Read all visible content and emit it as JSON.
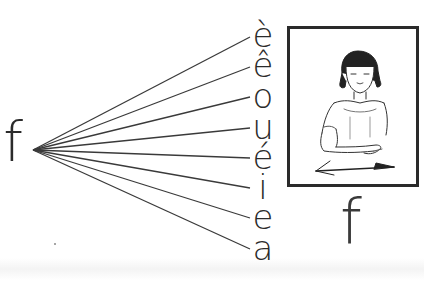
{
  "diagram": {
    "source_letter": "f",
    "target_vowels": [
      "è",
      "ê",
      "o",
      "u",
      "é",
      "i",
      "e",
      "a"
    ],
    "caption_letter": "f",
    "illustration": {
      "subject": "girl-signing-letter-f",
      "description": "Girl with bob haircut moving hand to the left, arrow pointing left"
    },
    "colors": {
      "ink": "#2b2b2b",
      "frame": "#2a2a2a",
      "background": "#ffffff"
    },
    "fan_origin": {
      "x": 33,
      "y": 150
    },
    "fan_endpoints": [
      {
        "x": 250,
        "y": 37
      },
      {
        "x": 250,
        "y": 67
      },
      {
        "x": 250,
        "y": 97
      },
      {
        "x": 250,
        "y": 128
      },
      {
        "x": 250,
        "y": 158
      },
      {
        "x": 250,
        "y": 188
      },
      {
        "x": 250,
        "y": 218
      },
      {
        "x": 250,
        "y": 249
      }
    ]
  }
}
